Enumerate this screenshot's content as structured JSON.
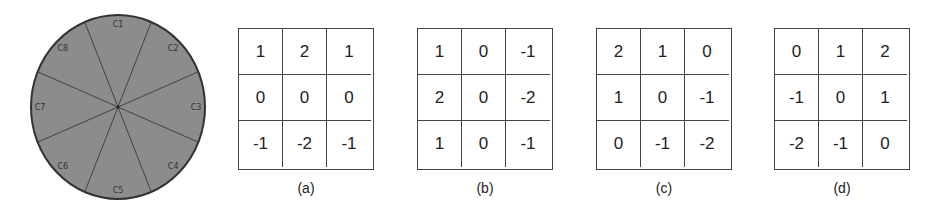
{
  "circle": {
    "fill_color": "#8c8c8c",
    "border_color": "#333333",
    "sectors": [
      {
        "label": "C1",
        "angle_deg": 0
      },
      {
        "label": "C2",
        "angle_deg": 45
      },
      {
        "label": "C3",
        "angle_deg": 90
      },
      {
        "label": "C4",
        "angle_deg": 135
      },
      {
        "label": "C5",
        "angle_deg": 180
      },
      {
        "label": "C6",
        "angle_deg": 225
      },
      {
        "label": "C7",
        "angle_deg": 270
      },
      {
        "label": "C8",
        "angle_deg": 315
      }
    ]
  },
  "kernels": [
    {
      "caption": "(a)",
      "values": [
        [
          "1",
          "2",
          "1"
        ],
        [
          "0",
          "0",
          "0"
        ],
        [
          "-1",
          "-2",
          "-1"
        ]
      ]
    },
    {
      "caption": "(b)",
      "values": [
        [
          "1",
          "0",
          "-1"
        ],
        [
          "2",
          "0",
          "-2"
        ],
        [
          "1",
          "0",
          "-1"
        ]
      ]
    },
    {
      "caption": "(c)",
      "values": [
        [
          "2",
          "1",
          "0"
        ],
        [
          "1",
          "0",
          "-1"
        ],
        [
          "0",
          "-1",
          "-2"
        ]
      ]
    },
    {
      "caption": "(d)",
      "values": [
        [
          "0",
          "1",
          "2"
        ],
        [
          "-1",
          "0",
          "1"
        ],
        [
          "-2",
          "-1",
          "0"
        ]
      ]
    }
  ]
}
